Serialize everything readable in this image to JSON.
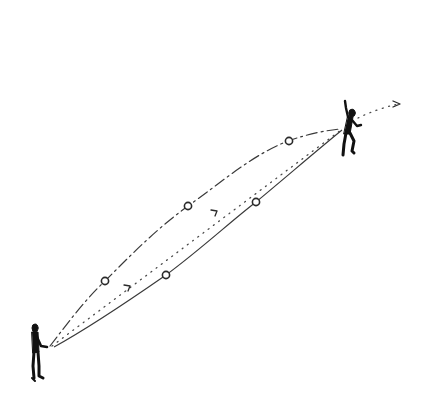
{
  "diagram": {
    "figures": [
      {
        "name": "thrower",
        "pose": "standing, arms forward"
      },
      {
        "name": "receiver",
        "pose": "leaping, arm raised"
      }
    ],
    "trajectories": [
      {
        "name": "upper-arc",
        "style": "dash-dot",
        "marker_count": 3
      },
      {
        "name": "straight-line",
        "style": "dotted",
        "arrow_count": 3
      },
      {
        "name": "lower-arc",
        "style": "solid",
        "marker_count": 2
      }
    ],
    "colors": {
      "background": "#ffffff",
      "ink": "#111111",
      "line": "#3a3a3a"
    }
  }
}
